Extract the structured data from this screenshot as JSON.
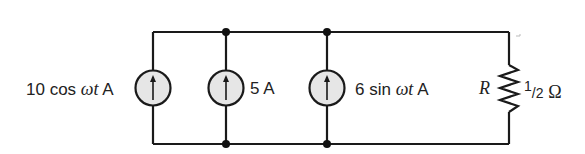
{
  "diagram": {
    "type": "circuit",
    "topology": "parallel",
    "sources": [
      {
        "id": "src1",
        "label_value": "10 cos ",
        "label_var": "ωt",
        "label_unit": " A",
        "direction": "up"
      },
      {
        "id": "src2",
        "label_value": "5 A",
        "direction": "up"
      },
      {
        "id": "src3",
        "label_value": "6 sin ",
        "label_var": "ωt",
        "label_unit": " A",
        "direction": "up"
      }
    ],
    "resistor": {
      "symbol": "R",
      "value_num": "1",
      "value_den": "2",
      "unit": "Ω"
    },
    "colors": {
      "wire": "#1a1a1a",
      "source_fill": "#e6e6e6",
      "node": "#111111"
    }
  }
}
